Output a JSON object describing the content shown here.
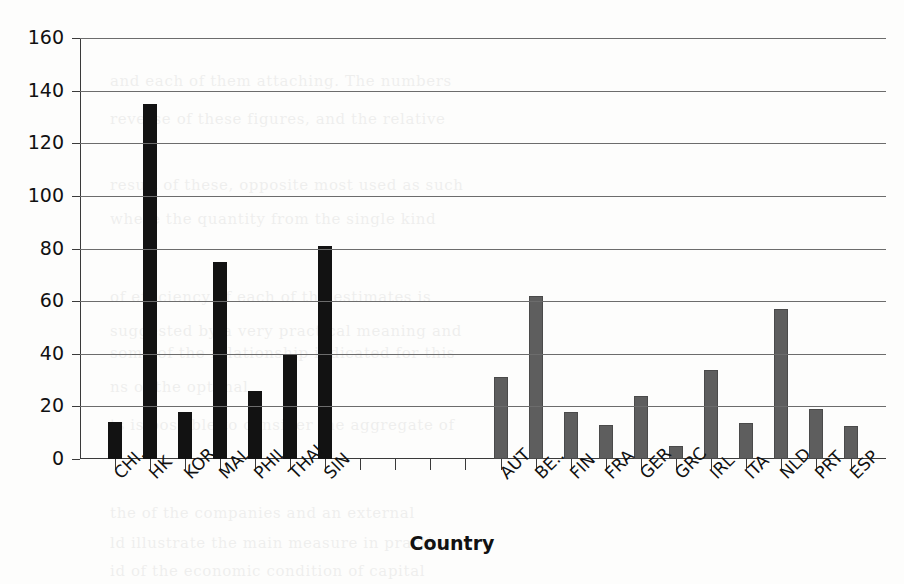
{
  "chart_data": {
    "type": "bar",
    "title": "",
    "xlabel": "Country",
    "ylabel": "",
    "ylim": [
      0,
      160
    ],
    "ytick_step": 20,
    "yticks": [
      0,
      20,
      40,
      60,
      80,
      100,
      120,
      140,
      160
    ],
    "grid": true,
    "legend": "none",
    "categories": [
      "CHI..",
      "HK",
      "KOR",
      "MAL",
      "PHIL",
      "THAI",
      "SIN",
      "",
      "",
      "",
      "",
      "AUT",
      "BE..",
      "FIN",
      "FRA",
      "GER",
      "GRC",
      "IRL",
      "ITA",
      "NLD",
      "PRT",
      "ESP"
    ],
    "values": [
      14,
      135,
      18,
      75,
      26,
      40,
      81,
      null,
      null,
      null,
      null,
      31,
      62,
      18,
      13,
      24,
      5,
      34,
      13.5,
      57,
      19,
      12.5
    ],
    "groups": [
      {
        "name": "asia",
        "color": "#121212",
        "categories": [
          "CHI..",
          "HK",
          "KOR",
          "MAL",
          "PHIL",
          "THAI",
          "SIN"
        ],
        "values": [
          14,
          135,
          18,
          75,
          26,
          40,
          81
        ]
      },
      {
        "name": "europe",
        "color": "#5e5e5e",
        "categories": [
          "AUT",
          "BE..",
          "FIN",
          "FRA",
          "GER",
          "GRC",
          "IRL",
          "ITA",
          "NLD",
          "PRT",
          "ESP"
        ],
        "values": [
          31,
          62,
          18,
          13,
          24,
          5,
          34,
          13.5,
          57,
          19,
          12.5
        ]
      }
    ],
    "empty_slots": 4
  },
  "axis": {
    "x_title": "Country",
    "y_tick_labels": [
      "160",
      "140",
      "120",
      "100",
      "80",
      "60",
      "40",
      "20",
      "0"
    ]
  },
  "bleed_text": [
    "and each of them attaching. The numbers",
    "reverse of these figures, and the relative",
    "result of these, opposite most used as such",
    "where the quantity from the single kind",
    "of efficiency of each of the estimates is",
    "suggested by a very practical meaning and",
    "some of the relationship indicated for this",
    "ns of the optimal",
    "ts is possible to consider the aggregate of",
    "the of the companies and an external",
    "ld illustrate the main measure in practice",
    "id of the economic condition of capital"
  ]
}
